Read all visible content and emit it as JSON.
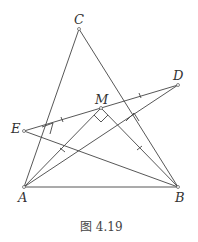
{
  "figure": {
    "caption": "图 4.19",
    "points": {
      "A": {
        "label": "A",
        "x": 24,
        "y": 187
      },
      "B": {
        "label": "B",
        "x": 178,
        "y": 187
      },
      "C": {
        "label": "C",
        "x": 79,
        "y": 29
      },
      "D": {
        "label": "D",
        "x": 178,
        "y": 85
      },
      "E": {
        "label": "E",
        "x": 24,
        "y": 131
      },
      "M": {
        "label": "M",
        "x": 101,
        "y": 108
      }
    },
    "segments": [
      "AB",
      "AC",
      "BC",
      "ED",
      "EB",
      "AD",
      "AM",
      "BM"
    ],
    "tick_marks": [
      "EM",
      "MD",
      "AM",
      "BM"
    ],
    "right_angles": [
      "E-foot on AC",
      "M (AM⊥BM)",
      "D-foot on BC"
    ]
  }
}
